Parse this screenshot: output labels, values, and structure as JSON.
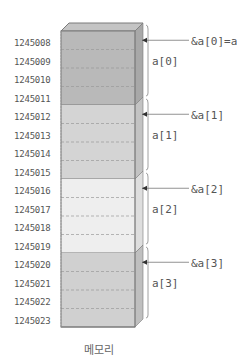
{
  "title": "",
  "caption": "메모리",
  "layout": {
    "front_left": 61,
    "front_right": 135,
    "top_y": 31,
    "row_height": 18.5,
    "depth_dx": 8,
    "depth_dy": 8
  },
  "colors": {
    "block_0": "#b9b9b9",
    "block_1": "#d4d4d4",
    "block_2": "#eeeeee",
    "block_3": "#d0d0d0",
    "side_0": "#a8a8a8",
    "side_1": "#c3c3c3",
    "side_2": "#dedede",
    "side_3": "#bfbfbf",
    "top": "#c4c4c4",
    "edge": "#7a7a7a",
    "dash": "#999999",
    "text": "#555555"
  },
  "addresses": [
    "1245008",
    "1245009",
    "1245010",
    "1245011",
    "1245012",
    "1245013",
    "1245014",
    "1245015",
    "1245016",
    "1245017",
    "1245018",
    "1245019",
    "1245020",
    "1245021",
    "1245022",
    "1245023"
  ],
  "elements": [
    {
      "name": "a[0]",
      "pointer": "&a[0]=a",
      "start_row": 0,
      "rows": 4
    },
    {
      "name": "a[1]",
      "pointer": "&a[1]",
      "start_row": 4,
      "rows": 4
    },
    {
      "name": "a[2]",
      "pointer": "&a[2]",
      "start_row": 8,
      "rows": 4
    },
    {
      "name": "a[3]",
      "pointer": "&a[3]",
      "start_row": 12,
      "rows": 4
    }
  ]
}
